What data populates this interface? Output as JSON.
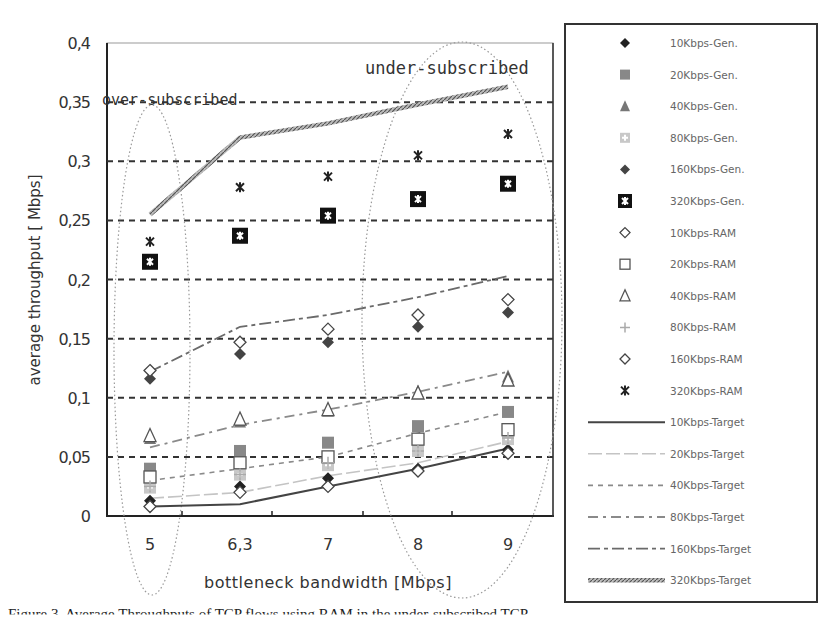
{
  "chart_data": {
    "type": "scatter",
    "title": "",
    "xlabel": "bottleneck bandwidth [Mbps]",
    "ylabel": "average throughput [ Mbps]",
    "categories": [
      "5",
      "6,3",
      "7",
      "8",
      "9"
    ],
    "ylim": [
      0,
      0.4
    ],
    "yticks": [
      "0",
      "0,05",
      "0,1",
      "0,15",
      "0,2",
      "0,25",
      "0,3",
      "0,35",
      "0,4"
    ],
    "grid": "horizontal dashed",
    "legend_position": "right",
    "annotations": [
      "over-subscribed",
      "under-subscribed"
    ],
    "series": [
      {
        "name": "10Kbps-Gen.",
        "kind": "marker",
        "values": [
          0.013,
          0.025,
          0.032,
          0.04,
          0.056
        ]
      },
      {
        "name": "20Kbps-Gen.",
        "kind": "marker",
        "values": [
          0.04,
          0.055,
          0.062,
          0.076,
          0.088
        ]
      },
      {
        "name": "40Kbps-Gen.",
        "kind": "marker",
        "values": [
          0.066,
          0.08,
          0.089,
          0.105,
          0.118
        ]
      },
      {
        "name": "80Kbps-Gen.",
        "kind": "marker",
        "values": [
          0.024,
          0.035,
          0.043,
          0.055,
          0.065
        ]
      },
      {
        "name": "160Kbps-Gen.",
        "kind": "marker",
        "values": [
          0.116,
          0.137,
          0.147,
          0.16,
          0.172
        ]
      },
      {
        "name": "320Kbps-Gen.",
        "kind": "marker",
        "values": [
          0.215,
          0.237,
          0.254,
          0.268,
          0.281
        ]
      },
      {
        "name": "10Kbps-RAM",
        "kind": "marker",
        "values": [
          0.008,
          0.02,
          0.025,
          0.038,
          0.053
        ]
      },
      {
        "name": "20Kbps-RAM",
        "kind": "marker",
        "values": [
          0.033,
          0.045,
          0.05,
          0.065,
          0.073
        ]
      },
      {
        "name": "40Kbps-RAM",
        "kind": "marker",
        "values": [
          0.068,
          0.082,
          0.09,
          0.104,
          0.115
        ]
      },
      {
        "name": "80Kbps-RAM",
        "kind": "marker",
        "values": [
          0.025,
          0.035,
          0.045,
          0.055,
          0.066
        ]
      },
      {
        "name": "160Kbps-RAM",
        "kind": "marker",
        "values": [
          0.123,
          0.147,
          0.158,
          0.17,
          0.183
        ]
      },
      {
        "name": "320Kbps-RAM",
        "kind": "marker",
        "values": [
          0.232,
          0.278,
          0.287,
          0.305,
          0.323
        ]
      },
      {
        "name": "10Kbps-Target",
        "kind": "line",
        "values": [
          0.008,
          0.01,
          0.025,
          0.04,
          0.057
        ]
      },
      {
        "name": "20Kbps-Target",
        "kind": "line",
        "values": [
          0.015,
          0.02,
          0.034,
          0.045,
          0.063
        ]
      },
      {
        "name": "40Kbps-Target",
        "kind": "line",
        "values": [
          0.03,
          0.04,
          0.05,
          0.07,
          0.088
        ]
      },
      {
        "name": "80Kbps-Target",
        "kind": "line",
        "values": [
          0.058,
          0.077,
          0.09,
          0.105,
          0.122
        ]
      },
      {
        "name": "160Kbps-Target",
        "kind": "line",
        "values": [
          0.122,
          0.16,
          0.17,
          0.185,
          0.203
        ]
      },
      {
        "name": "320Kbps-Target",
        "kind": "line",
        "values": [
          0.255,
          0.32,
          0.332,
          0.348,
          0.363
        ]
      }
    ]
  },
  "legend": {
    "items": [
      {
        "label": "10Kbps-Gen.",
        "glyph": "filled-diamond",
        "color": "#222222"
      },
      {
        "label": "20Kbps-Gen.",
        "glyph": "filled-square",
        "color": "#888888"
      },
      {
        "label": "40Kbps-Gen.",
        "glyph": "filled-triangle",
        "color": "#777777"
      },
      {
        "label": "80Kbps-Gen.",
        "glyph": "light-square-cross",
        "color": "#c8c8c8"
      },
      {
        "label": "160Kbps-Gen.",
        "glyph": "filled-diamond",
        "color": "#444444"
      },
      {
        "label": "320Kbps-Gen.",
        "glyph": "black-box-star",
        "color": "#111111"
      },
      {
        "label": "10Kbps-RAM",
        "glyph": "open-diamond",
        "color": "#444444"
      },
      {
        "label": "20Kbps-RAM",
        "glyph": "open-square",
        "color": "#555555"
      },
      {
        "label": "40Kbps-RAM",
        "glyph": "open-triangle",
        "color": "#555555"
      },
      {
        "label": "80Kbps-RAM",
        "glyph": "plus",
        "color": "#aaaaaa"
      },
      {
        "label": "160Kbps-RAM",
        "glyph": "open-diamond",
        "color": "#444444"
      },
      {
        "label": "320Kbps-RAM",
        "glyph": "asterisk",
        "color": "#222222"
      },
      {
        "label": "10Kbps-Target",
        "glyph": "solid-line",
        "color": "#444444"
      },
      {
        "label": "20Kbps-Target",
        "glyph": "light-dash-line",
        "color": "#bbbbbb"
      },
      {
        "label": "40Kbps-Target",
        "glyph": "short-dash-line",
        "color": "#888888"
      },
      {
        "label": "80Kbps-Target",
        "glyph": "dash-dot-line",
        "color": "#888888"
      },
      {
        "label": "160Kbps-Target",
        "glyph": "long-dash-dot-line",
        "color": "#666666"
      },
      {
        "label": "320Kbps-Target",
        "glyph": "thick-hatched-line",
        "color": "#777777"
      }
    ]
  },
  "axes": {
    "xlabel": "bottleneck bandwidth [Mbps]",
    "ylabel": "average throughput [ Mbps]",
    "x_ticks": [
      "5",
      "6,3",
      "7",
      "8",
      "9"
    ],
    "y_ticks": [
      "0",
      "0,05",
      "0,1",
      "0,15",
      "0,2",
      "0,25",
      "0,3",
      "0,35",
      "0,4"
    ]
  },
  "annotations": {
    "over": "over-subscribed",
    "under": "under-subscribed"
  },
  "caption": "Figure 3. Average Throughputs of TCP flows using RAM in the under-subscribed TCP"
}
